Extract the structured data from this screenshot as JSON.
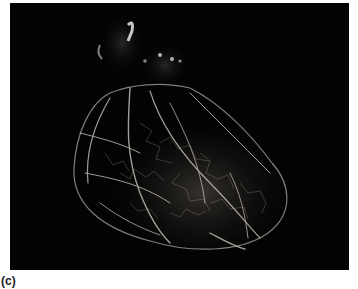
{
  "figure": {
    "panel_label": "(c)",
    "background_color": "#030303",
    "vessel_color": "#d8d2c8"
  }
}
